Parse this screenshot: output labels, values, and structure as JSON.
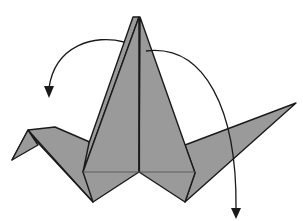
{
  "diagram": {
    "title": "Origami crane folding step",
    "colors": {
      "paper": "#9a9a9a",
      "line": "#1a1a1a",
      "background": "#ffffff"
    },
    "parts": [
      {
        "name": "head",
        "label": "Head"
      },
      {
        "name": "neck-flap",
        "label": "Neck flap"
      },
      {
        "name": "body-left",
        "label": "Body left"
      },
      {
        "name": "body-right",
        "label": "Body right"
      },
      {
        "name": "tail",
        "label": "Tail"
      }
    ],
    "arrows": [
      {
        "name": "fold-arrow-left",
        "direction": "down-left",
        "meaning": "fold wing down (left)"
      },
      {
        "name": "fold-arrow-right",
        "direction": "down-right",
        "meaning": "fold wing down (right)"
      }
    ]
  }
}
